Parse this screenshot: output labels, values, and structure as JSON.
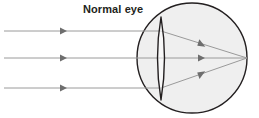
{
  "figure": {
    "title": "Normal eye",
    "type": "optics-ray-diagram",
    "canvas": {
      "width": 259,
      "height": 118,
      "background": "#ffffff"
    },
    "colors": {
      "title_text": "#231f20",
      "eyeball_outline": "#231f20",
      "eyeball_fill": "#efefef",
      "lens_outline": "#231f20",
      "lens_fill": "#fdfdfd",
      "ray_line": "#9a9a9a",
      "arrow_head": "#6e6e6e"
    },
    "eyeball": {
      "label": "eyeball",
      "center_x": 192,
      "center_y": 58,
      "radius": 55,
      "stroke_width": 1.4
    },
    "lens": {
      "label": "crystalline lens",
      "center_x": 161,
      "top_y": 17,
      "bottom_y": 100,
      "half_width": 6,
      "stroke_width": 1.4
    },
    "focal_point": {
      "label": "retina focal point",
      "x": 247,
      "y": 58
    },
    "incoming_rays": [
      {
        "label": "upper parallel ray",
        "start_x": 4,
        "y": 31,
        "arrow_x": 63
      },
      {
        "label": "middle parallel ray",
        "start_x": 4,
        "y": 58,
        "arrow_x": 63
      },
      {
        "label": "lower parallel ray",
        "start_x": 4,
        "y": 88,
        "arrow_x": 63
      }
    ],
    "refracted_rays": [
      {
        "label": "upper refracted ray",
        "from_x": 161,
        "from_y": 31,
        "to_x": 247,
        "to_y": 58,
        "arrow_t": 0.52
      },
      {
        "label": "middle refracted ray",
        "from_x": 161,
        "from_y": 58,
        "to_x": 247,
        "to_y": 58,
        "arrow_t": 0.52
      },
      {
        "label": "lower refracted ray",
        "from_x": 161,
        "from_y": 88,
        "to_x": 247,
        "to_y": 58,
        "arrow_t": 0.52
      }
    ]
  }
}
